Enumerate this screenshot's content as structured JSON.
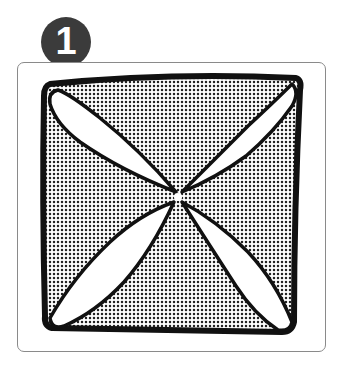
{
  "figure": {
    "step_number": "1",
    "badge_color": "#3b3b3b",
    "frame_border_color": "#8a8a8a",
    "illustration": {
      "description": "Square with four white petal shapes radiating from center to each corner; triangles between petals shaded with halftone dots",
      "outline_color": "#111111",
      "shade_pattern": "halftone-dots",
      "petals": 4,
      "shaded_triangles": 4
    }
  }
}
